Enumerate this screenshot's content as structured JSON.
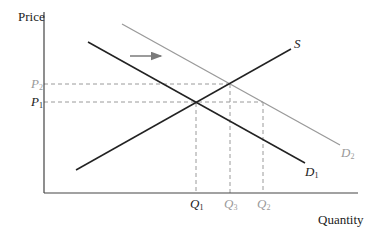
{
  "diagram": {
    "axes": {
      "y_label": "Price",
      "x_label": "Quantity"
    },
    "curves": [
      {
        "id": "S",
        "label": "S",
        "sub": "",
        "color": "#222222"
      },
      {
        "id": "D1",
        "label": "D",
        "sub": "1",
        "color": "#222222"
      },
      {
        "id": "D2",
        "label": "D",
        "sub": "2",
        "color": "#9a9a9a"
      }
    ],
    "price_levels": [
      {
        "label": "P",
        "sub": "2",
        "color": "#9a9a9a"
      },
      {
        "label": "P",
        "sub": "1",
        "color": "#222222"
      }
    ],
    "quantity_levels": [
      {
        "label": "Q",
        "sub": "1",
        "color": "#222222"
      },
      {
        "label": "Q",
        "sub": "3",
        "color": "#9a9a9a"
      },
      {
        "label": "Q",
        "sub": "2",
        "color": "#9a9a9a"
      }
    ],
    "shift_arrow": {
      "direction": "right",
      "color": "#7a7a7a"
    },
    "colors": {
      "axis": "#444444",
      "dark_line": "#222222",
      "light_line": "#9a9a9a",
      "dashed": "#9a9a9a"
    }
  }
}
